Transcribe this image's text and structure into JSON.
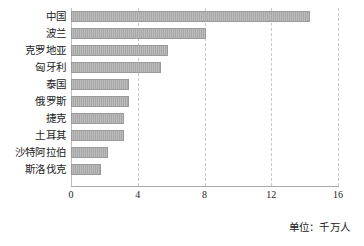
{
  "chart_data": {
    "type": "bar",
    "orientation": "horizontal",
    "title": "",
    "subtitle": "",
    "xlabel": "",
    "ylabel": "",
    "unit_note": "单位：千万人",
    "categories": [
      "中国",
      "波兰",
      "克罗地亚",
      "匈牙利",
      "泰国",
      "俄罗斯",
      "捷克",
      "土耳其",
      "沙特阿拉伯",
      "斯洛伐克"
    ],
    "values": [
      14.3,
      8.1,
      5.8,
      5.4,
      3.5,
      3.5,
      3.2,
      3.2,
      2.2,
      1.8
    ],
    "series": [
      {
        "name": "",
        "values": [
          14.3,
          8.1,
          5.8,
          5.4,
          3.5,
          3.5,
          3.2,
          3.2,
          2.2,
          1.8
        ]
      }
    ],
    "xlim": [
      0,
      16
    ],
    "xticks": [
      0,
      4,
      8,
      12,
      16
    ],
    "xtick_labels": [
      "0",
      "4",
      "8",
      "12",
      "16"
    ],
    "grid": true,
    "grid_axis": "x",
    "grid_style": "dashed",
    "legend": false,
    "legend_position": "none",
    "colors": {
      "bar_fill": "#a8a8a8",
      "bar_border": "#9a9a9a",
      "gridline": "#c9c9c9",
      "axis": "#a9a9a9",
      "text": "#1a1a1a",
      "background": "#ffffff"
    }
  }
}
